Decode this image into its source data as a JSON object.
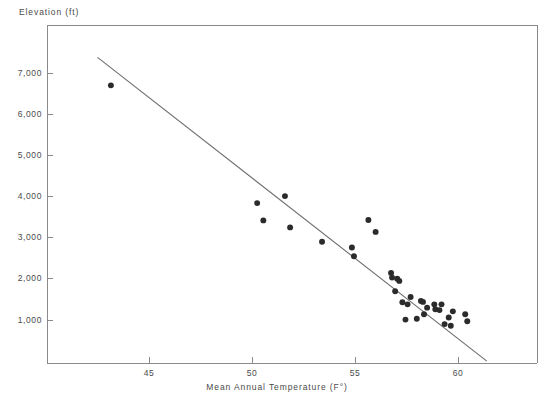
{
  "chart_data": {
    "type": "scatter",
    "title": "",
    "xlabel": "Mean Annual Temperature (F°)",
    "ylabel": "Elevation (ft)",
    "xlim": [
      41.0,
      62.0
    ],
    "ylim": [
      0,
      7600
    ],
    "xticks": [
      45,
      50,
      55,
      60
    ],
    "xtick_labels": [
      "45",
      "50",
      "55",
      "60"
    ],
    "yticks": [
      1000,
      2000,
      3000,
      4000,
      5000,
      6000,
      7000
    ],
    "ytick_labels": [
      "1,000",
      "2,000",
      "3,000",
      "4,000",
      "5,000",
      "6,000",
      "7,000"
    ],
    "grid": false,
    "legend": null,
    "marker": {
      "shape": "circle",
      "color": "#2b2b2b",
      "size": 4
    },
    "series": [
      {
        "name": "Weather stations",
        "points": [
          [
            43.15,
            6700
          ],
          [
            50.25,
            3840
          ],
          [
            50.55,
            3420
          ],
          [
            51.6,
            4010
          ],
          [
            51.85,
            3250
          ],
          [
            53.4,
            2900
          ],
          [
            54.85,
            2760
          ],
          [
            54.95,
            2550
          ],
          [
            55.65,
            3430
          ],
          [
            56.0,
            3140
          ],
          [
            56.75,
            2140
          ],
          [
            56.8,
            2030
          ],
          [
            57.05,
            2000
          ],
          [
            57.15,
            1950
          ],
          [
            56.95,
            1700
          ],
          [
            57.7,
            1560
          ],
          [
            57.3,
            1430
          ],
          [
            57.55,
            1380
          ],
          [
            58.2,
            1460
          ],
          [
            58.3,
            1440
          ],
          [
            58.5,
            1300
          ],
          [
            58.35,
            1140
          ],
          [
            58.0,
            1030
          ],
          [
            58.9,
            1260
          ],
          [
            59.1,
            1240
          ],
          [
            59.55,
            1060
          ],
          [
            59.35,
            900
          ],
          [
            59.65,
            860
          ],
          [
            60.35,
            1140
          ],
          [
            60.45,
            970
          ],
          [
            59.2,
            1380
          ],
          [
            59.75,
            1210
          ],
          [
            58.85,
            1380
          ],
          [
            57.45,
            1010
          ]
        ]
      }
    ],
    "trendline": {
      "name": "Least-squares fit",
      "x_start": 42.5,
      "y_start": 7380,
      "x_end": 61.4,
      "y_end": 0,
      "color": "#6e6e6e"
    }
  },
  "axes": {
    "y_title": "Elevation (ft)",
    "x_title": "Mean Annual Temperature (F°)"
  }
}
